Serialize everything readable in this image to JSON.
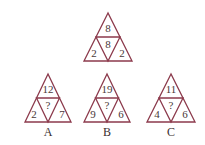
{
  "puzzle": {
    "line_color": "#8c3a4c",
    "text_color": "#4a3838",
    "example": {
      "top": "8",
      "center": "8",
      "left": "2",
      "right": "2"
    },
    "options": [
      {
        "label": "A",
        "top": "12",
        "center": "?",
        "left": "2",
        "right": "7"
      },
      {
        "label": "B",
        "top": "19",
        "center": "?",
        "left": "9",
        "right": "6"
      },
      {
        "label": "C",
        "top": "11",
        "center": "?",
        "left": "4",
        "right": "6"
      }
    ]
  }
}
